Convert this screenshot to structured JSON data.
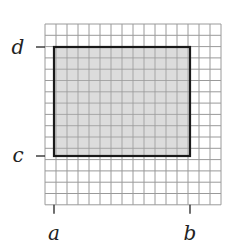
{
  "diagram": {
    "grid": {
      "x0": 45,
      "y0": 24,
      "cols": 16,
      "rows": 16,
      "cell_w": 11,
      "cell_h": 11.3,
      "line_color": "#9a9a9a"
    },
    "rectangle": {
      "x": 54,
      "y": 47,
      "width": 136,
      "height": 109,
      "fill": "#dcdcdc",
      "stroke": "#1a1a1a",
      "stroke_width": 2.2
    },
    "axis_labels": {
      "d": {
        "text": "d",
        "tick_y": 47,
        "label_x": 18,
        "label_y": 54
      },
      "c": {
        "text": "c",
        "tick_y": 156,
        "label_x": 18,
        "label_y": 162
      },
      "a": {
        "text": "a",
        "tick_x": 54,
        "label_x": 54,
        "label_y": 240
      },
      "b": {
        "text": "b",
        "tick_x": 190,
        "label_x": 190,
        "label_y": 240
      }
    }
  }
}
